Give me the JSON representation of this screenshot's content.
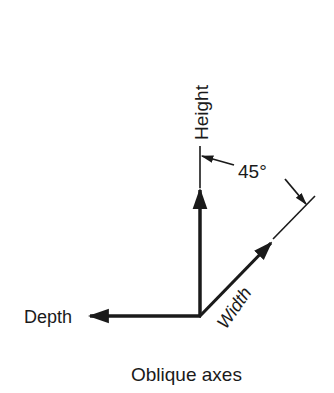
{
  "diagram": {
    "type": "oblique-axes",
    "caption": "Oblique axes",
    "axes": {
      "height": {
        "label": "Height"
      },
      "depth": {
        "label": "Depth"
      },
      "width": {
        "label": "Width"
      }
    },
    "angle": {
      "label": "45°",
      "value": 45
    },
    "colors": {
      "line": "#1a1a1a",
      "background": "#ffffff"
    }
  }
}
